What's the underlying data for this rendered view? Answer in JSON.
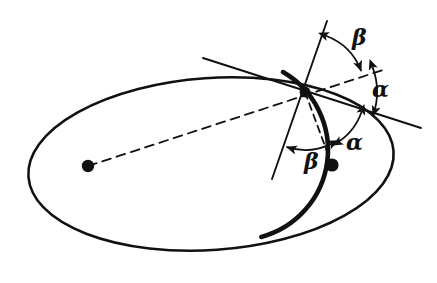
{
  "figure": {
    "background_color": "#ffffff",
    "ink_color": "#111111",
    "width": 437,
    "height": 283
  },
  "labels": {
    "alpha_upper": "α",
    "alpha_lower": "α",
    "beta_upper": "β",
    "beta_lower": "β"
  },
  "label_positions": {
    "alpha_upper": {
      "x": 372,
      "y": 78,
      "size": 22
    },
    "alpha_lower": {
      "x": 346,
      "y": 131,
      "size": 22
    },
    "beta_upper": {
      "x": 352,
      "y": 26,
      "size": 22
    },
    "beta_lower": {
      "x": 304,
      "y": 150,
      "size": 22
    }
  },
  "geometry": {
    "ellipse": {
      "name": "ellipse-outline",
      "center_x": 211,
      "center_y": 164,
      "radius_x": 183,
      "radius_y": 86,
      "rotation_deg": -4,
      "stroke_width": 2.6
    },
    "circle_arc": {
      "name": "circle-arc",
      "center_x": 238,
      "center_y": 150,
      "radius": 90,
      "start_deg": -60,
      "end_deg": 75,
      "stroke_width": 4.6
    },
    "intersection_point": {
      "x": 305,
      "y": 92
    },
    "focus_left": {
      "x": 88,
      "y": 166,
      "radius": 6.2
    },
    "focus_right": {
      "x": 332,
      "y": 165,
      "radius": 6.6
    },
    "dashed_chord": {
      "name": "focal-chord-dashed",
      "x1": 88,
      "y1": 166,
      "x2": 386,
      "y2": 69,
      "dash": "9 6",
      "stroke_width": 1.8
    },
    "dashed_focal_radius": {
      "name": "focal-radius-dashed",
      "x1": 305,
      "y1": 92,
      "x2": 332,
      "y2": 165,
      "dash": "7 5",
      "stroke_width": 1.8
    },
    "tangent_ellipse": {
      "name": "ellipse-tangent-line",
      "x1": 203,
      "y1": 58,
      "x2": 421,
      "y2": 128,
      "stroke_width": 1.9
    },
    "tangent_circle": {
      "name": "circle-tangent-line",
      "x1": 327,
      "y1": 21,
      "x2": 272,
      "y2": 179,
      "stroke_width": 1.9
    }
  },
  "angle_arcs": {
    "beta_upper_arc": {
      "name": "beta-upper-arc",
      "vertex_x": 305,
      "vertex_y": 92,
      "radius": 60,
      "from_deg": -69,
      "to_deg": -21,
      "stroke_width": 1.8,
      "arrow_start": true,
      "arrow_end": true
    },
    "alpha_upper_arc": {
      "name": "alpha-upper-arc",
      "vertex_x": 305,
      "vertex_y": 92,
      "radius": 72,
      "from_deg": -20,
      "to_deg": 19,
      "stroke_width": 1.8,
      "arrow_start": true,
      "arrow_end": true
    },
    "alpha_lower_arc": {
      "name": "alpha-lower-arc",
      "vertex_x": 305,
      "vertex_y": 92,
      "radius": 60,
      "from_deg": 20,
      "to_deg": 62,
      "stroke_width": 1.8,
      "arrow_start": true,
      "arrow_end": true
    },
    "beta_lower_arc": {
      "name": "beta-lower-arc",
      "vertex_x": 305,
      "vertex_y": 92,
      "radius": 58,
      "from_deg": 64,
      "to_deg": 108,
      "stroke_width": 1.8,
      "arrow_start": true,
      "arrow_end": true
    }
  }
}
